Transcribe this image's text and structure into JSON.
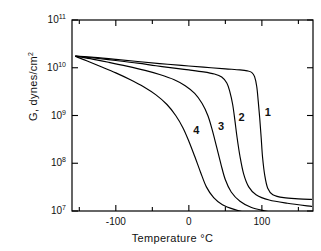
{
  "chart_data": {
    "type": "line",
    "title": "",
    "xlabel": "Temperature °C",
    "ylabel": "G, dynes/cm2",
    "ylabel_display": "G, dynes/cm",
    "ylabel_exponent": "2",
    "xlim": [
      -160,
      170
    ],
    "ylim": [
      10000000.0,
      100000000000.0
    ],
    "yscale": "log",
    "xscale": "linear",
    "grid": false,
    "legend": "inline-curve-labels",
    "xticks": [
      -150,
      -100,
      -50,
      0,
      50,
      100,
      150
    ],
    "xtick_labels": [
      "",
      "-100",
      "",
      "0",
      "",
      "100",
      ""
    ],
    "xtick_major": [
      -100,
      0,
      100
    ],
    "yticks": [
      10000000.0,
      100000000.0,
      1000000000.0,
      10000000000.0,
      100000000000.0
    ],
    "ytick_labels": [
      "10",
      "10",
      "10",
      "10",
      "10"
    ],
    "ytick_exponents": [
      "7",
      "8",
      "9",
      "10",
      "11"
    ],
    "series": [
      {
        "name": "1",
        "label": "1",
        "label_x": 108,
        "label_y": 1100000000.0,
        "points": [
          [
            -155,
            17500000000.0
          ],
          [
            -130,
            16500000000.0
          ],
          [
            -100,
            15000000000.0
          ],
          [
            -70,
            13500000000.0
          ],
          [
            -40,
            12200000000.0
          ],
          [
            -10,
            11200000000.0
          ],
          [
            20,
            10300000000.0
          ],
          [
            50,
            9500000000.0
          ],
          [
            70,
            9000000000.0
          ],
          [
            80,
            8600000000.0
          ],
          [
            86,
            8000000000.0
          ],
          [
            90,
            6500000000.0
          ],
          [
            93,
            4000000000.0
          ],
          [
            95,
            2000000000.0
          ],
          [
            97,
            900000000.0
          ],
          [
            99,
            350000000.0
          ],
          [
            101,
            130000000.0
          ],
          [
            104,
            55000000.0
          ],
          [
            108,
            30000000.0
          ],
          [
            115,
            22000000.0
          ],
          [
            130,
            19000000.0
          ],
          [
            150,
            18000000.0
          ],
          [
            168,
            17500000.0
          ]
        ]
      },
      {
        "name": "2",
        "label": "2",
        "label_x": 72,
        "label_y": 850000000.0,
        "points": [
          [
            -155,
            17500000000.0
          ],
          [
            -130,
            16000000000.0
          ],
          [
            -100,
            14200000000.0
          ],
          [
            -70,
            12500000000.0
          ],
          [
            -45,
            11000000000.0
          ],
          [
            -20,
            9800000000.0
          ],
          [
            0,
            9000000000.0
          ],
          [
            20,
            8200000000.0
          ],
          [
            35,
            7400000000.0
          ],
          [
            45,
            6400000000.0
          ],
          [
            52,
            4800000000.0
          ],
          [
            56,
            3200000000.0
          ],
          [
            60,
            1700000000.0
          ],
          [
            63,
            800000000.0
          ],
          [
            66,
            350000000.0
          ],
          [
            70,
            140000000.0
          ],
          [
            75,
            60000000.0
          ],
          [
            82,
            32000000.0
          ],
          [
            92,
            22000000.0
          ],
          [
            110,
            17000000.0
          ],
          [
            135,
            14500000.0
          ],
          [
            168,
            12500000.0
          ]
        ]
      },
      {
        "name": "3",
        "label": "3",
        "label_x": 44,
        "label_y": 550000000.0,
        "points": [
          [
            -155,
            17500000000.0
          ],
          [
            -135,
            15500000000.0
          ],
          [
            -110,
            13000000000.0
          ],
          [
            -85,
            10800000000.0
          ],
          [
            -60,
            8800000000.0
          ],
          [
            -40,
            7200000000.0
          ],
          [
            -20,
            5600000000.0
          ],
          [
            -5,
            4200000000.0
          ],
          [
            8,
            2900000000.0
          ],
          [
            18,
            1800000000.0
          ],
          [
            26,
            1000000000.0
          ],
          [
            32,
            500000000.0
          ],
          [
            38,
            220000000.0
          ],
          [
            44,
            95000000.0
          ],
          [
            50,
            45000000.0
          ],
          [
            58,
            25000000.0
          ],
          [
            70,
            16000000.0
          ],
          [
            85,
            12000000.0
          ],
          [
            105,
            10000000.0
          ],
          [
            120,
            9000000.0
          ]
        ]
      },
      {
        "name": "4",
        "label": "4",
        "label_x": 10,
        "label_y": 450000000.0,
        "points": [
          [
            -155,
            17200000000.0
          ],
          [
            -140,
            14000000000.0
          ],
          [
            -120,
            10500000000.0
          ],
          [
            -100,
            7800000000.0
          ],
          [
            -80,
            5600000000.0
          ],
          [
            -62,
            4000000000.0
          ],
          [
            -45,
            2700000000.0
          ],
          [
            -30,
            1700000000.0
          ],
          [
            -18,
            1000000000.0
          ],
          [
            -8,
            550000000.0
          ],
          [
            0,
            290000000.0
          ],
          [
            8,
            140000000.0
          ],
          [
            16,
            65000000.0
          ],
          [
            24,
            32000000.0
          ],
          [
            34,
            19000000.0
          ],
          [
            46,
            13500000.0
          ],
          [
            62,
            10800000.0
          ],
          [
            80,
            9200000.0
          ],
          [
            100,
            8400000.0
          ]
        ]
      }
    ]
  },
  "axes": {
    "frame_color": "#000000",
    "line_color": "#000000"
  }
}
